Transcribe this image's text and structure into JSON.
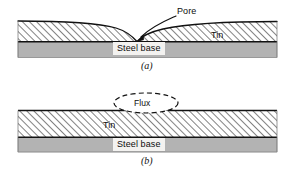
{
  "figure": {
    "panels": [
      {
        "id": "panel-a",
        "caption": "(a)",
        "description": "Tin coating over steel base with a pore forming a V-shaped void down to the steel base",
        "labels": {
          "pore": "Pore",
          "tin": "Tin",
          "steel_base": "Steel base"
        }
      },
      {
        "id": "panel-b",
        "caption": "(b)",
        "description": "Tin coating over steel base with a flux bubble trapped at the surface",
        "labels": {
          "flux": "Flux",
          "tin": "Tin",
          "steel_base": "Steel base"
        }
      }
    ],
    "colors": {
      "steel_base_fill": "#b3b3b3",
      "tin_hatch_line": "#4a4a4a",
      "tin_fill": "#ffffff",
      "outline": "#111111",
      "label_box_fill": "#f3f2f0",
      "background": "#ffffff"
    },
    "icon_names": {
      "pore_pointer": "curved-arrow-icon",
      "flux_bubble": "dashed-ellipse-icon",
      "hatch_pattern": "diagonal-hatch-icon"
    }
  }
}
